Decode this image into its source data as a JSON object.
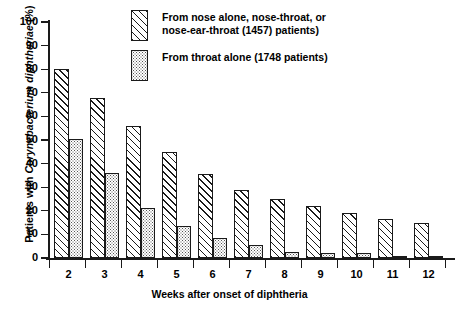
{
  "chart_data": {
    "type": "bar",
    "title": "",
    "xlabel": "Weeks after onset of diphtheria",
    "ylabel": "Patients with Corynebacterium diphtheriae (%)",
    "ylabel_plain_prefix": "Patients with ",
    "ylabel_italic": "Corynebacterium diphtheriae",
    "ylabel_plain_suffix": " (%)",
    "categories": [
      "2",
      "3",
      "4",
      "5",
      "6",
      "7",
      "8",
      "9",
      "10",
      "11",
      "12"
    ],
    "series": [
      {
        "name": "From nose alone, nose-throat, or nose-ear-throat (1457) patients)",
        "pattern": "diagonal-hatch",
        "values": [
          80,
          68,
          56,
          45,
          35.5,
          29,
          25,
          22,
          19,
          16.5,
          15
        ]
      },
      {
        "name": "From throat alone (1748 patients)",
        "pattern": "stipple",
        "values": [
          50.5,
          36,
          21,
          13.5,
          8.5,
          5.5,
          2.5,
          2,
          2,
          1,
          1
        ]
      }
    ],
    "ylim": [
      0,
      100
    ],
    "ytick_values": [
      "0",
      "10",
      "20",
      "30",
      "40",
      "50",
      "60",
      "70",
      "80",
      "90",
      "100"
    ],
    "ytick_numbers": [
      0,
      10,
      20,
      30,
      40,
      50,
      60,
      70,
      80,
      90,
      100
    ],
    "grid": false,
    "legend_position": "top-center"
  },
  "legend": {
    "entries": [
      {
        "swatch": "diagonal-hatch-swatch",
        "line1": "From nose alone, nose-throat, or",
        "line2": "nose-ear-throat (1457) patients)",
        "text": "From nose alone, nose-throat, or\nnose-ear-throat (1457) patients)"
      },
      {
        "swatch": "stipple-swatch",
        "line1": "From throat alone (1748 patients)",
        "line2": "",
        "text": "From throat alone (1748 patients)"
      }
    ]
  },
  "colors": {
    "ink": "#1a1a1a",
    "background": "#ffffff",
    "stipple_dot": "#555555"
  }
}
